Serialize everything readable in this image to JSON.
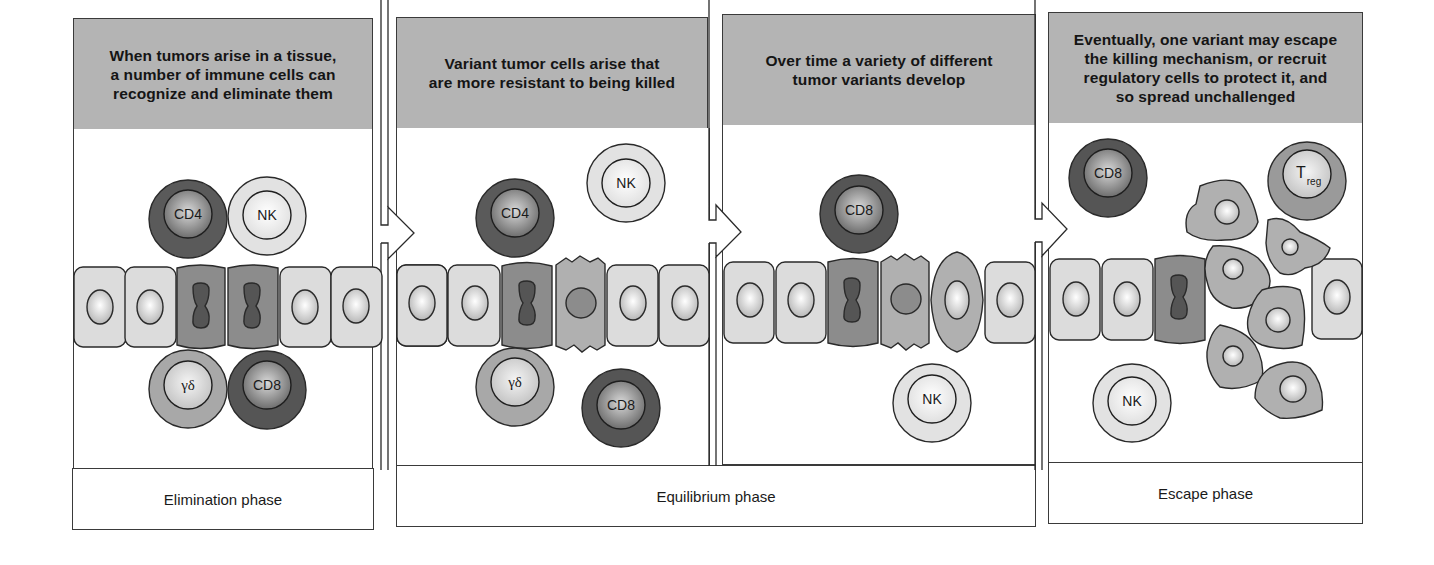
{
  "panels": [
    {
      "id": "elimination",
      "caption": "When tumors arise in a tissue, a number of immune cells can recognize and eliminate them",
      "caption_lines": [
        "When tumors arise in a tissue,",
        "a number of immune cells can",
        "recognize and eliminate them"
      ],
      "immune_cells": [
        "CD4",
        "NK",
        "γδ",
        "CD8"
      ]
    },
    {
      "id": "equilibrium-1",
      "caption": "Variant tumor cells arise that are more resistant to being killed",
      "caption_lines": [
        "Variant tumor cells arise that",
        "are more resistant to being killed"
      ],
      "immune_cells": [
        "CD4",
        "NK",
        "γδ",
        "CD8"
      ]
    },
    {
      "id": "equilibrium-2",
      "caption": "Over time a variety of different tumor variants develop",
      "caption_lines": [
        "Over time a variety of different",
        "tumor variants develop"
      ],
      "immune_cells": [
        "CD8",
        "NK"
      ]
    },
    {
      "id": "escape",
      "caption": "Eventually, one variant may escape the killing mechanism, or recruit regulatory cells to protect it, and so spread unchallenged",
      "caption_lines": [
        "Eventually, one variant may escape",
        "the killing mechanism, or recruit",
        "regulatory cells to protect it, and",
        "so spread unchallenged"
      ],
      "immune_cells": [
        "CD8",
        "Treg",
        "NK"
      ]
    }
  ],
  "phases": {
    "elimination": "Elimination phase",
    "equilibrium": "Equilibrium phase",
    "escape": "Escape phase"
  },
  "cell_labels": {
    "cd4": "CD4",
    "cd8": "CD8",
    "nk": "NK",
    "gd": "γδ",
    "treg_main": "T",
    "treg_sub": "reg"
  },
  "colors": {
    "header_bg": "#b4b4b4",
    "normal_cell": "#dcdcdc",
    "tumor_cell": "#8c8c8c",
    "variant_cell": "#b0b0b0",
    "cd4_cd8_outer": "#5a5a5a",
    "nk_outer": "#e2e2e2",
    "gd_outer": "#a8a8a8",
    "treg_outer": "#9a9a9a",
    "outline": "#2a2a2a"
  }
}
